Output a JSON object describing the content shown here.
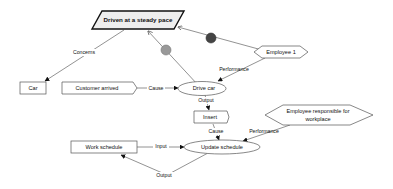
{
  "diagram": {
    "colors": {
      "node_stroke": "#555555",
      "goal_stroke": "#111111",
      "goal_fill": "#eeeeee",
      "edge": "#777777",
      "arrow": "#111111",
      "connector_grey": "#999999",
      "connector_dark": "#444444"
    },
    "nodes": {
      "goal": {
        "label": "Driven at a steady pace",
        "shape": "parallelogram"
      },
      "car": {
        "label": "Car",
        "shape": "rectangle"
      },
      "customer_arrived": {
        "label": "Customer arrived",
        "shape": "pentagon-arrow"
      },
      "drive_car": {
        "label": "Drive car",
        "shape": "ellipse"
      },
      "employee1": {
        "label": "Employee 1",
        "shape": "hexagon"
      },
      "insert": {
        "label": "Insert",
        "shape": "pentagon-arrow"
      },
      "employee_resp_line1": {
        "label": "Employee responsible for"
      },
      "employee_resp_line2": {
        "label": "workplace"
      },
      "work_schedule": {
        "label": "Work schedule",
        "shape": "rectangle"
      },
      "update_schedule": {
        "label": "Update schedule",
        "shape": "ellipse"
      }
    },
    "edges": {
      "concerns": {
        "label": "Concerns"
      },
      "cause1": {
        "label": "Cause"
      },
      "performance1": {
        "label": "Performance"
      },
      "output1": {
        "label": "Output"
      },
      "cause2": {
        "label": "Cause"
      },
      "performance2": {
        "label": "Performance"
      },
      "input": {
        "label": "Input"
      },
      "output2": {
        "label": "Output"
      }
    }
  }
}
